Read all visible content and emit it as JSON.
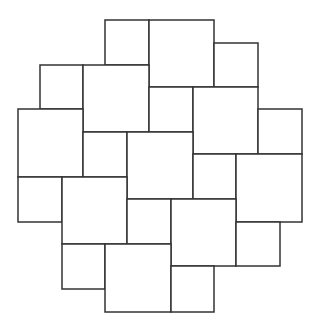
{
  "diagram": {
    "type": "pythagorean-tiling",
    "stroke_color": "#333333",
    "fill_color": "#ffffff",
    "background": "#ffffff",
    "tiles": [
      {
        "size": "small",
        "x": 105,
        "y": 20,
        "w": 44,
        "h": 45
      },
      {
        "size": "large",
        "x": 149,
        "y": 20,
        "w": 65,
        "h": 67
      },
      {
        "size": "small",
        "x": 214,
        "y": 43,
        "w": 44,
        "h": 44
      },
      {
        "size": "small",
        "x": 40,
        "y": 65,
        "w": 43,
        "h": 44
      },
      {
        "size": "large",
        "x": 83,
        "y": 65,
        "w": 66,
        "h": 67
      },
      {
        "size": "small",
        "x": 149,
        "y": 87,
        "w": 44,
        "h": 45
      },
      {
        "size": "large",
        "x": 193,
        "y": 87,
        "w": 65,
        "h": 67
      },
      {
        "size": "small",
        "x": 258,
        "y": 109,
        "w": 44,
        "h": 45
      },
      {
        "size": "large",
        "x": 18,
        "y": 109,
        "w": 65,
        "h": 68
      },
      {
        "size": "small",
        "x": 83,
        "y": 132,
        "w": 44,
        "h": 45
      },
      {
        "size": "large",
        "x": 127,
        "y": 132,
        "w": 66,
        "h": 67
      },
      {
        "size": "small",
        "x": 193,
        "y": 154,
        "w": 43,
        "h": 45
      },
      {
        "size": "large",
        "x": 236,
        "y": 154,
        "w": 66,
        "h": 68
      },
      {
        "size": "small",
        "x": 18,
        "y": 177,
        "w": 44,
        "h": 45
      },
      {
        "size": "large",
        "x": 62,
        "y": 177,
        "w": 65,
        "h": 67
      },
      {
        "size": "small",
        "x": 127,
        "y": 199,
        "w": 44,
        "h": 45
      },
      {
        "size": "large",
        "x": 171,
        "y": 199,
        "w": 65,
        "h": 67
      },
      {
        "size": "small",
        "x": 236,
        "y": 222,
        "w": 44,
        "h": 44
      },
      {
        "size": "small",
        "x": 62,
        "y": 244,
        "w": 43,
        "h": 45
      },
      {
        "size": "large",
        "x": 105,
        "y": 244,
        "w": 66,
        "h": 68
      },
      {
        "size": "small",
        "x": 171,
        "y": 266,
        "w": 43,
        "h": 46
      }
    ]
  }
}
